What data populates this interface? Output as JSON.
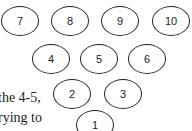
{
  "pins": [
    {
      "label": "7"
    },
    {
      "label": "8"
    },
    {
      "label": "9"
    },
    {
      "label": "10"
    },
    {
      "label": "4"
    },
    {
      "label": "5"
    },
    {
      "label": "6"
    },
    {
      "label": "2"
    },
    {
      "label": "3"
    },
    {
      "label": "1"
    }
  ],
  "text": {
    "line1": "the 4-5,",
    "line2": "rying to"
  }
}
